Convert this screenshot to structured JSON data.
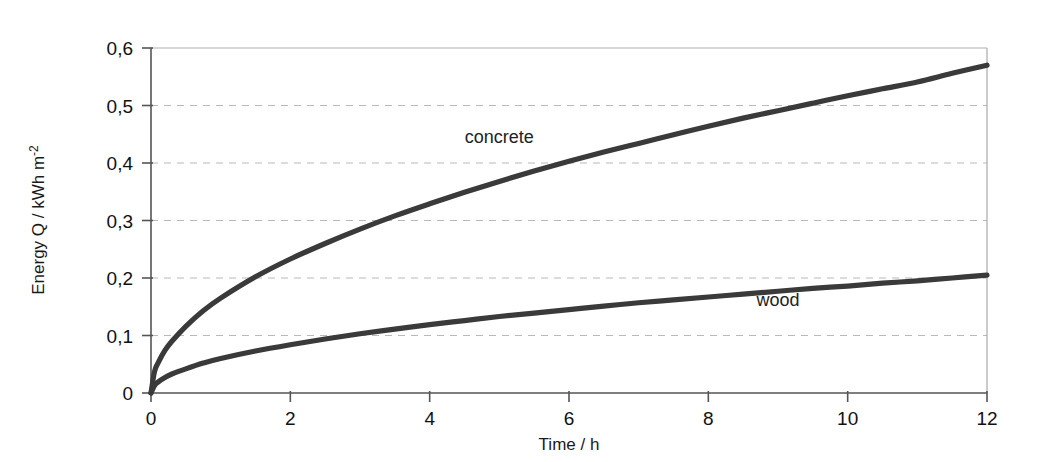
{
  "chart_data": {
    "type": "line",
    "title": "",
    "subtitle": "",
    "xlabel": "Time / h",
    "ylabel": "Energy Q / kWh m",
    "ylabel_superscript": "-2",
    "xlim": [
      0,
      12
    ],
    "ylim": [
      0,
      0.6
    ],
    "grid": true,
    "grid_axis": "y",
    "legend_position": "inline-annotation",
    "xticks": [
      0,
      2,
      4,
      6,
      8,
      10,
      12
    ],
    "xtick_labels": [
      "0",
      "2",
      "4",
      "6",
      "8",
      "10",
      "12"
    ],
    "yticks": [
      0,
      0.1,
      0.2,
      0.3,
      0.4,
      0.5,
      0.6
    ],
    "ytick_labels": [
      "0",
      "0,1",
      "0,2",
      "0,3",
      "0,4",
      "0,5",
      "0,6"
    ],
    "x": [
      0,
      0.05,
      0.1,
      0.2,
      0.3,
      0.5,
      0.75,
      1,
      1.5,
      2,
      2.5,
      3,
      3.5,
      4,
      4.5,
      5,
      5.5,
      6,
      6.5,
      7,
      7.5,
      8,
      8.5,
      9,
      9.5,
      10,
      10.5,
      11,
      11.5,
      12
    ],
    "series": [
      {
        "name": "concrete",
        "color": "#3a3a3a",
        "label": "concrete",
        "label_x": 5.0,
        "label_y": 0.435,
        "values": [
          0.0,
          0.037,
          0.052,
          0.074,
          0.09,
          0.116,
          0.143,
          0.165,
          0.202,
          0.233,
          0.26,
          0.285,
          0.308,
          0.329,
          0.349,
          0.368,
          0.386,
          0.403,
          0.419,
          0.434,
          0.449,
          0.464,
          0.478,
          0.491,
          0.504,
          0.517,
          0.529,
          0.541,
          0.556,
          0.57
        ]
      },
      {
        "name": "wood",
        "color": "#3a3a3a",
        "label": "wood",
        "label_x": 9.0,
        "label_y": 0.152,
        "values": [
          0.0,
          0.013,
          0.019,
          0.027,
          0.033,
          0.042,
          0.052,
          0.06,
          0.073,
          0.084,
          0.094,
          0.103,
          0.111,
          0.119,
          0.126,
          0.133,
          0.139,
          0.145,
          0.151,
          0.157,
          0.162,
          0.167,
          0.172,
          0.177,
          0.182,
          0.186,
          0.191,
          0.195,
          0.2,
          0.205
        ]
      }
    ],
    "colors": {
      "curve": "#3a3a3a",
      "axis": "#555555",
      "grid": "#b9b9b9",
      "background": "#ffffff",
      "text": "#111111"
    },
    "geometry": {
      "plot_left": 151,
      "plot_right": 987,
      "plot_top": 48,
      "plot_bottom": 393
    }
  }
}
